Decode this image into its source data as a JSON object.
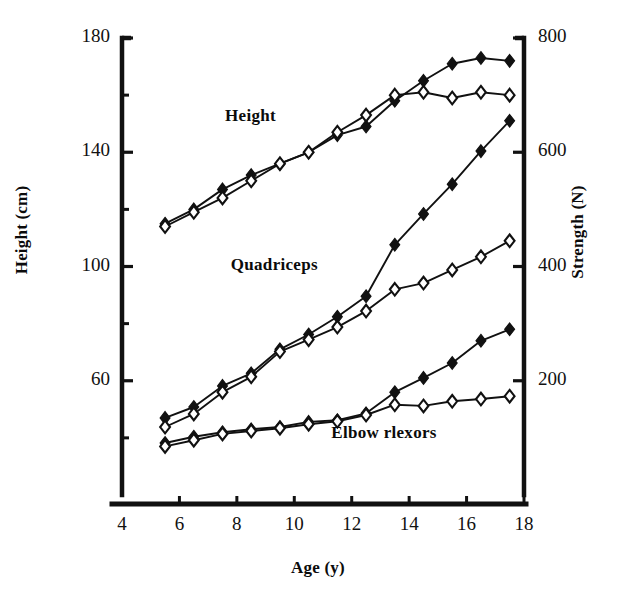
{
  "chart_data": {
    "type": "line",
    "title": "",
    "xlabel": "Age (y)",
    "ylabel": "Height (cm)",
    "y2label": "Strength  (N)",
    "xlim": [
      4,
      18
    ],
    "ylim": [
      20,
      180
    ],
    "y2lim": [
      0,
      800
    ],
    "grid": false,
    "legend": "inline-annotations",
    "x_ticks": [
      "4",
      "6",
      "8",
      "10",
      "12",
      "14",
      "16",
      "18"
    ],
    "x_tick_values": [
      4,
      6,
      8,
      10,
      12,
      14,
      16,
      18
    ],
    "y_ticks": [
      "60",
      "100",
      "140",
      "180"
    ],
    "y_tick_values": [
      60,
      100,
      140,
      180
    ],
    "y_minor_tick_values": [
      40,
      80,
      120,
      160
    ],
    "y2_ticks": [
      "200",
      "400",
      "600",
      "800"
    ],
    "y2_tick_values": [
      200,
      400,
      600,
      800
    ],
    "marker_filled": "filled-diamond",
    "marker_open": "open-diamond",
    "x": [
      5.5,
      6.5,
      7.5,
      8.5,
      9.5,
      10.5,
      11.5,
      12.5,
      13.5,
      14.5,
      15.5,
      16.5,
      17.5
    ],
    "series": [
      {
        "name": "Height boys",
        "group": "Height",
        "axis": "left",
        "marker": "filled-diamond",
        "units": "cm",
        "values": [
          115,
          120,
          127,
          132,
          136,
          140,
          146,
          149,
          158,
          165,
          171,
          173,
          172
        ]
      },
      {
        "name": "Height girls",
        "group": "Height",
        "axis": "left",
        "marker": "open-diamond",
        "units": "cm",
        "values": [
          114,
          119,
          124,
          130,
          136,
          140,
          147,
          153,
          160,
          161,
          159,
          161,
          160
        ]
      },
      {
        "name": "Quadriceps boys",
        "group": "Quadriceps",
        "axis": "right",
        "marker": "filled-diamond",
        "units": "N",
        "values": [
          135,
          154,
          191,
          213,
          255,
          281,
          312,
          348,
          438,
          492,
          544,
          602,
          655
        ]
      },
      {
        "name": "Quadriceps girls",
        "group": "Quadriceps",
        "axis": "right",
        "marker": "open-diamond",
        "units": "N",
        "values": [
          119,
          142,
          180,
          207,
          251,
          272,
          294,
          322,
          360,
          371,
          394,
          417,
          445
        ]
      },
      {
        "name": "Elbow flexors boys",
        "group": "Elbow rlexors",
        "axis": "right",
        "marker": "filled-diamond",
        "units": "N",
        "values": [
          91,
          102,
          110,
          115,
          119,
          128,
          131,
          143,
          180,
          205,
          231,
          270,
          290
        ]
      },
      {
        "name": "Elbow flexors girls",
        "group": "Elbow rlexors",
        "axis": "right",
        "marker": "open-diamond",
        "units": "N",
        "values": [
          85,
          96,
          107,
          112,
          117,
          124,
          129,
          140,
          158,
          156,
          164,
          168,
          173
        ]
      }
    ],
    "annotations": [
      {
        "text": "Height",
        "x": 9.4,
        "y_left": 152
      },
      {
        "text": "Quadriceps",
        "x": 9.6,
        "y_left": 100
      },
      {
        "text": "Elbow rlexors",
        "x": 13.1,
        "y_left": 41
      }
    ],
    "colors": {
      "line": "#111111",
      "marker_fill": "#111111",
      "marker_open_fill": "#ffffff",
      "axis": "#111111",
      "background": "#ffffff"
    }
  }
}
